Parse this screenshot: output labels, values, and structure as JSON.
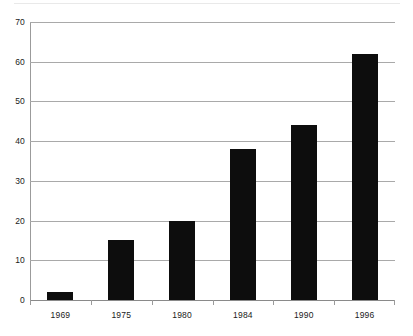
{
  "chart_data": {
    "type": "bar",
    "title": "",
    "subtitle": "",
    "xlabel": "",
    "ylabel": "",
    "categories": [
      "1969",
      "1975",
      "1980",
      "1984",
      "1990",
      "1996"
    ],
    "values": [
      2,
      15,
      20,
      38,
      44,
      62
    ],
    "ylim": [
      0,
      70
    ],
    "ytick_labels": [
      "0",
      "10",
      "20",
      "30",
      "40",
      "50",
      "60",
      "70"
    ],
    "ytick_values": [
      0,
      10,
      20,
      30,
      40,
      50,
      60,
      70
    ],
    "ytick_step": 10,
    "grid": true,
    "grid_axis": "y",
    "legend": false,
    "legend_position": "none",
    "series": [
      {
        "name": "",
        "values": [
          2,
          15,
          20,
          38,
          44,
          62
        ]
      }
    ],
    "colors": {
      "bar": "#0d0d0d",
      "gridline": "#a9a9a9",
      "axis": "#9b9b9b",
      "text": "#1a1a1a",
      "background": "#ffffff"
    }
  }
}
